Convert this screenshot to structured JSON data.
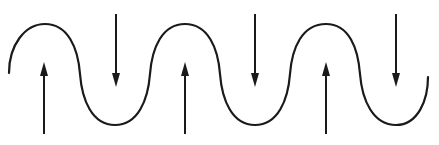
{
  "diagram": {
    "colors": {
      "background": "#ffffff",
      "stroke": "#1a1a1a"
    },
    "wave": {
      "start": [
        9,
        73
      ],
      "end": [
        428,
        77
      ],
      "peaks": [
        [
          45,
          24
        ],
        [
          185,
          24
        ],
        [
          326,
          24
        ]
      ],
      "troughs": [
        [
          115,
          125
        ],
        [
          255,
          125
        ],
        [
          396,
          125
        ]
      ]
    },
    "arrows": [
      {
        "direction": "up",
        "x": 44,
        "tip_y": 62,
        "base_y": 134
      },
      {
        "direction": "down",
        "x": 116,
        "tail_y": 14,
        "tip_y": 87
      },
      {
        "direction": "up",
        "x": 185,
        "tip_y": 62,
        "base_y": 134
      },
      {
        "direction": "down",
        "x": 255,
        "tail_y": 14,
        "tip_y": 87
      },
      {
        "direction": "up",
        "x": 326,
        "tip_y": 62,
        "base_y": 134
      },
      {
        "direction": "down",
        "x": 396,
        "tail_y": 14,
        "tip_y": 87
      }
    ]
  }
}
